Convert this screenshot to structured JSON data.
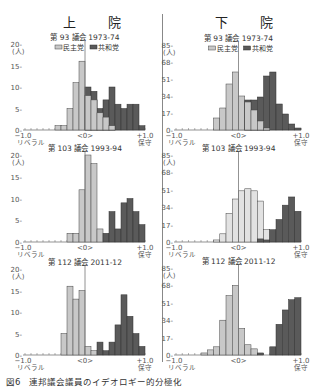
{
  "titles": {
    "senate": "上 院",
    "house": "下 院"
  },
  "caption": "図6　連邦議会議員のイデオロギー的分極化",
  "legend": {
    "dem": "民主党",
    "rep": "共和党"
  },
  "axis": {
    "left": "−1.0",
    "left_sub": "リベラル",
    "center": "<0>",
    "right": "+1.0",
    "right_sub": "保守",
    "unit": "(人)"
  },
  "colors": {
    "dem": "#c8c8c8",
    "rep": "#5a5a5a",
    "edge": "#444444",
    "house103dem": "#e2e2e2"
  },
  "chart_data": [
    {
      "type": "bar",
      "chamber": "senate",
      "title": "第 93 議会 1973-74",
      "ymax": 20,
      "yticks": [
        0,
        5,
        10,
        15,
        20
      ],
      "xlabel": "ideology (-1.0 liberal to +1.0 conservative)",
      "ylabel": "(人)",
      "bins_start": -1.0,
      "bin_width": 0.1,
      "series": [
        {
          "name": "民主党",
          "values": [
            0,
            0,
            0,
            0,
            0,
            1,
            1,
            5,
            11,
            16,
            8,
            7,
            4,
            3,
            1,
            0,
            0,
            0,
            0,
            0
          ]
        },
        {
          "name": "共和党",
          "values": [
            0,
            0,
            0,
            0,
            0,
            0,
            0,
            0,
            0,
            0,
            10,
            9,
            5,
            7,
            10,
            6,
            5,
            6,
            6,
            1
          ]
        }
      ]
    },
    {
      "type": "bar",
      "chamber": "house",
      "title": "第 93 議会 1973-74",
      "ymax": 85,
      "yticks": [
        0,
        17,
        34,
        51,
        68,
        85
      ],
      "bins_start": -1.0,
      "bin_width": 0.1,
      "series": [
        {
          "name": "民主党",
          "values": [
            0,
            0,
            0,
            0,
            0,
            0,
            12,
            22,
            46,
            58,
            34,
            28,
            20,
            9,
            2,
            0,
            0,
            0,
            0,
            0
          ]
        },
        {
          "name": "共和党",
          "values": [
            0,
            0,
            0,
            0,
            0,
            0,
            0,
            0,
            0,
            0,
            0,
            30,
            30,
            33,
            54,
            58,
            26,
            16,
            6,
            2
          ]
        }
      ]
    },
    {
      "type": "bar",
      "chamber": "senate",
      "title": "第 103 議会 1993-94",
      "ymax": 20,
      "yticks": [
        0,
        5,
        10,
        15,
        20
      ],
      "bins_start": -1.0,
      "bin_width": 0.1,
      "series": [
        {
          "name": "民主党",
          "values": [
            0,
            0,
            0,
            0,
            0,
            0,
            0,
            2,
            2,
            12,
            20,
            18,
            3,
            0,
            0,
            0,
            0,
            0,
            0,
            0
          ]
        },
        {
          "name": "共和党",
          "values": [
            0,
            0,
            0,
            0,
            0,
            0,
            0,
            0,
            0,
            0,
            0,
            0,
            0,
            2,
            7,
            3,
            9,
            10,
            7,
            4
          ]
        }
      ]
    },
    {
      "type": "bar",
      "chamber": "house",
      "title": "第 103 議会 1993-94",
      "ymax": 85,
      "yticks": [
        0,
        17,
        34,
        51,
        68,
        85
      ],
      "bins_start": -1.0,
      "bin_width": 0.1,
      "series": [
        {
          "name": "民主党",
          "values": [
            0,
            0,
            0,
            0,
            0,
            0,
            2,
            8,
            28,
            42,
            50,
            52,
            50,
            40,
            12,
            0,
            0,
            0,
            0,
            0
          ]
        },
        {
          "name": "共和党",
          "values": [
            0,
            0,
            0,
            0,
            0,
            0,
            0,
            0,
            0,
            0,
            0,
            0,
            0,
            3,
            2,
            12,
            22,
            36,
            44,
            30
          ]
        }
      ]
    },
    {
      "type": "bar",
      "chamber": "senate",
      "title": "第 112 議会 2011-12",
      "ymax": 20,
      "yticks": [
        0,
        5,
        10,
        15,
        20
      ],
      "bins_start": -1.0,
      "bin_width": 0.1,
      "series": [
        {
          "name": "民主党",
          "values": [
            0,
            0,
            0,
            0,
            0,
            0,
            5,
            16,
            13,
            15,
            2,
            1,
            0,
            0,
            0,
            0,
            0,
            0,
            0,
            0
          ]
        },
        {
          "name": "共和党",
          "values": [
            0,
            0,
            0,
            0,
            0,
            0,
            0,
            0,
            0,
            0,
            0,
            0,
            3,
            1,
            3,
            7,
            14,
            9,
            5,
            2
          ]
        }
      ]
    },
    {
      "type": "bar",
      "chamber": "house",
      "title": "第 112 議会 2011-12",
      "ymax": 85,
      "yticks": [
        0,
        17,
        34,
        51,
        68,
        85
      ],
      "bins_start": -1.0,
      "bin_width": 0.1,
      "series": [
        {
          "name": "民主党",
          "values": [
            0,
            0,
            0,
            0,
            2,
            5,
            8,
            34,
            58,
            68,
            26,
            10,
            6,
            0,
            0,
            0,
            0,
            0,
            0,
            0
          ]
        },
        {
          "name": "共和党",
          "values": [
            0,
            0,
            0,
            0,
            0,
            0,
            0,
            0,
            0,
            0,
            0,
            0,
            0,
            2,
            0,
            8,
            30,
            44,
            54,
            56
          ]
        }
      ]
    }
  ]
}
